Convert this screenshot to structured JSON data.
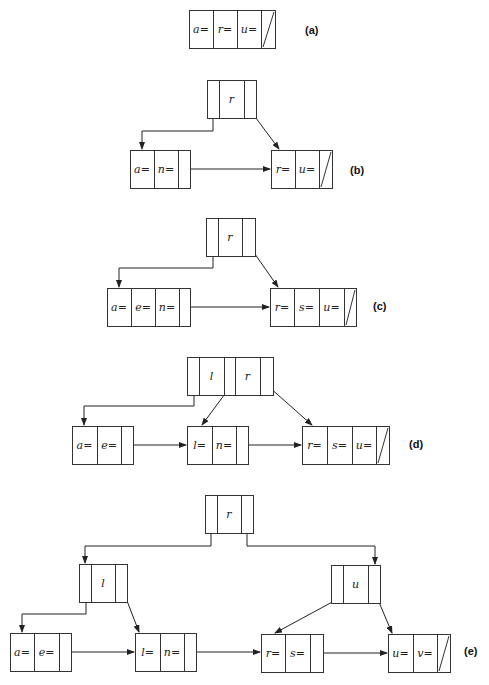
{
  "figure": {
    "panels": [
      {
        "id": "a",
        "label": "(a)",
        "label_pos": [
          305,
          34
        ],
        "nodes": [
          {
            "id": "a-leaf",
            "type": "leaf",
            "x": 189,
            "y": 10,
            "h": 38,
            "cells": [
              {
                "w": 24,
                "text": "a="
              },
              {
                "w": 24,
                "text": "r="
              },
              {
                "w": 24,
                "text": "u="
              },
              {
                "w": 14,
                "text": "",
                "null": true
              }
            ]
          }
        ],
        "edges": []
      },
      {
        "id": "b",
        "label": "(b)",
        "label_pos": [
          350,
          174
        ],
        "nodes": [
          {
            "id": "b-root",
            "type": "internal",
            "x": 207,
            "y": 80,
            "h": 38,
            "cells": [
              {
                "w": 12,
                "text": ""
              },
              {
                "w": 25,
                "text": "r"
              },
              {
                "w": 12,
                "text": ""
              }
            ]
          },
          {
            "id": "b-leaf1",
            "type": "leaf",
            "x": 130,
            "y": 150,
            "h": 38,
            "cells": [
              {
                "w": 24,
                "text": "a="
              },
              {
                "w": 24,
                "text": "n="
              },
              {
                "w": 12,
                "text": ""
              }
            ]
          },
          {
            "id": "b-leaf2",
            "type": "leaf",
            "x": 271,
            "y": 150,
            "h": 38,
            "cells": [
              {
                "w": 24,
                "text": "r="
              },
              {
                "w": 24,
                "text": "u="
              },
              {
                "w": 13,
                "text": "",
                "null": true
              }
            ]
          }
        ],
        "edges": [
          {
            "points": [
              [
                213,
                110
              ],
              [
                213,
                131
              ],
              [
                142,
                131
              ],
              [
                142,
                149
              ]
            ]
          },
          {
            "points": [
              [
                250,
                110
              ],
              [
                279,
                149
              ]
            ]
          },
          {
            "points": [
              [
                186,
                169
              ],
              [
                270,
                169
              ]
            ]
          }
        ]
      },
      {
        "id": "c",
        "label": "(c)",
        "label_pos": [
          373,
          310
        ],
        "nodes": [
          {
            "id": "c-root",
            "type": "internal",
            "x": 206,
            "y": 218,
            "h": 38,
            "cells": [
              {
                "w": 12,
                "text": ""
              },
              {
                "w": 24,
                "text": "r"
              },
              {
                "w": 13,
                "text": ""
              }
            ]
          },
          {
            "id": "c-leaf1",
            "type": "leaf",
            "x": 107,
            "y": 288,
            "h": 38,
            "cells": [
              {
                "w": 24,
                "text": "a="
              },
              {
                "w": 24,
                "text": "e="
              },
              {
                "w": 24,
                "text": "n="
              },
              {
                "w": 11,
                "text": ""
              }
            ]
          },
          {
            "id": "c-leaf2",
            "type": "leaf",
            "x": 270,
            "y": 288,
            "h": 38,
            "cells": [
              {
                "w": 24,
                "text": "r="
              },
              {
                "w": 25,
                "text": "s="
              },
              {
                "w": 25,
                "text": "u="
              },
              {
                "w": 12,
                "text": "",
                "null": true
              }
            ]
          }
        ],
        "edges": [
          {
            "points": [
              [
                213,
                247
              ],
              [
                213,
                268
              ],
              [
                119,
                268
              ],
              [
                119,
                287
              ]
            ]
          },
          {
            "points": [
              [
                250,
                247
              ],
              [
                278,
                287
              ]
            ]
          },
          {
            "points": [
              [
                187,
                307
              ],
              [
                269,
                307
              ]
            ]
          }
        ]
      },
      {
        "id": "d",
        "label": "(d)",
        "label_pos": [
          409,
          448
        ],
        "nodes": [
          {
            "id": "d-root",
            "type": "internal",
            "x": 187,
            "y": 357,
            "h": 38,
            "cells": [
              {
                "w": 12,
                "text": ""
              },
              {
                "w": 25,
                "text": "l"
              },
              {
                "w": 11,
                "text": ""
              },
              {
                "w": 25,
                "text": "r"
              },
              {
                "w": 13,
                "text": ""
              }
            ]
          },
          {
            "id": "d-leaf1",
            "type": "leaf",
            "x": 72,
            "y": 426,
            "h": 38,
            "cells": [
              {
                "w": 25,
                "text": "a="
              },
              {
                "w": 24,
                "text": "e="
              },
              {
                "w": 12,
                "text": ""
              }
            ]
          },
          {
            "id": "d-leaf2",
            "type": "leaf",
            "x": 187,
            "y": 426,
            "h": 38,
            "cells": [
              {
                "w": 25,
                "text": "l="
              },
              {
                "w": 24,
                "text": "n="
              },
              {
                "w": 12,
                "text": ""
              }
            ]
          },
          {
            "id": "d-leaf3",
            "type": "leaf",
            "x": 302,
            "y": 426,
            "h": 38,
            "cells": [
              {
                "w": 25,
                "text": "r="
              },
              {
                "w": 25,
                "text": "s="
              },
              {
                "w": 24,
                "text": "u="
              },
              {
                "w": 13,
                "text": "",
                "null": true
              }
            ]
          }
        ],
        "edges": [
          {
            "points": [
              [
                194,
                387
              ],
              [
                194,
                406
              ],
              [
                84,
                406
              ],
              [
                84,
                425
              ]
            ]
          },
          {
            "points": [
              [
                230,
                387
              ],
              [
                202,
                425
              ]
            ]
          },
          {
            "points": [
              [
                269,
                387
              ],
              [
                312,
                425
              ]
            ]
          },
          {
            "points": [
              [
                129,
                445
              ],
              [
                186,
                445
              ]
            ]
          },
          {
            "points": [
              [
                244,
                445
              ],
              [
                301,
                445
              ]
            ]
          }
        ]
      },
      {
        "id": "e",
        "label": "(e)",
        "label_pos": [
          464,
          655
        ],
        "nodes": [
          {
            "id": "e-root",
            "type": "internal",
            "x": 205,
            "y": 495,
            "h": 38,
            "cells": [
              {
                "w": 12,
                "text": ""
              },
              {
                "w": 24,
                "text": "r"
              },
              {
                "w": 12,
                "text": ""
              }
            ]
          },
          {
            "id": "e-mid1",
            "type": "internal",
            "x": 79,
            "y": 564,
            "h": 38,
            "cells": [
              {
                "w": 12,
                "text": ""
              },
              {
                "w": 24,
                "text": "l"
              },
              {
                "w": 12,
                "text": ""
              }
            ]
          },
          {
            "id": "e-mid2",
            "type": "internal",
            "x": 331,
            "y": 565,
            "h": 38,
            "cells": [
              {
                "w": 12,
                "text": ""
              },
              {
                "w": 25,
                "text": "u"
              },
              {
                "w": 12,
                "text": ""
              }
            ]
          },
          {
            "id": "e-leaf1",
            "type": "leaf",
            "x": 10,
            "y": 633,
            "h": 38,
            "cells": [
              {
                "w": 24,
                "text": "a="
              },
              {
                "w": 25,
                "text": "e="
              },
              {
                "w": 12,
                "text": ""
              }
            ]
          },
          {
            "id": "e-leaf2",
            "type": "leaf",
            "x": 135,
            "y": 633,
            "h": 38,
            "cells": [
              {
                "w": 25,
                "text": "l="
              },
              {
                "w": 24,
                "text": "n="
              },
              {
                "w": 12,
                "text": ""
              }
            ]
          },
          {
            "id": "e-leaf3",
            "type": "leaf",
            "x": 261,
            "y": 634,
            "h": 38,
            "cells": [
              {
                "w": 24,
                "text": "r="
              },
              {
                "w": 25,
                "text": "s="
              },
              {
                "w": 13,
                "text": ""
              }
            ]
          },
          {
            "id": "e-leaf4",
            "type": "leaf",
            "x": 388,
            "y": 634,
            "h": 38,
            "cells": [
              {
                "w": 25,
                "text": "u="
              },
              {
                "w": 24,
                "text": "v="
              },
              {
                "w": 13,
                "text": "",
                "null": true
              }
            ]
          }
        ],
        "edges": [
          {
            "points": [
              [
                211,
                527
              ],
              [
                211,
                546
              ],
              [
                85,
                546
              ],
              [
                85,
                563
              ]
            ]
          },
          {
            "points": [
              [
                247,
                527
              ],
              [
                247,
                546
              ],
              [
                375,
                546
              ],
              [
                375,
                564
              ]
            ]
          },
          {
            "points": [
              [
                86,
                596
              ],
              [
                86,
                614
              ],
              [
                22,
                614
              ],
              [
                22,
                632
              ]
            ]
          },
          {
            "points": [
              [
                124,
                593
              ],
              [
                139,
                632
              ]
            ]
          },
          {
            "points": [
              [
                336,
                600
              ],
              [
                275,
                633
              ]
            ]
          },
          {
            "points": [
              [
                376,
                595
              ],
              [
                392,
                633
              ]
            ]
          },
          {
            "points": [
              [
                67,
                652
              ],
              [
                134,
                652
              ]
            ]
          },
          {
            "points": [
              [
                193,
                652
              ],
              [
                260,
                652
              ]
            ]
          },
          {
            "points": [
              [
                319,
                653
              ],
              [
                387,
                653
              ]
            ]
          }
        ]
      }
    ]
  }
}
